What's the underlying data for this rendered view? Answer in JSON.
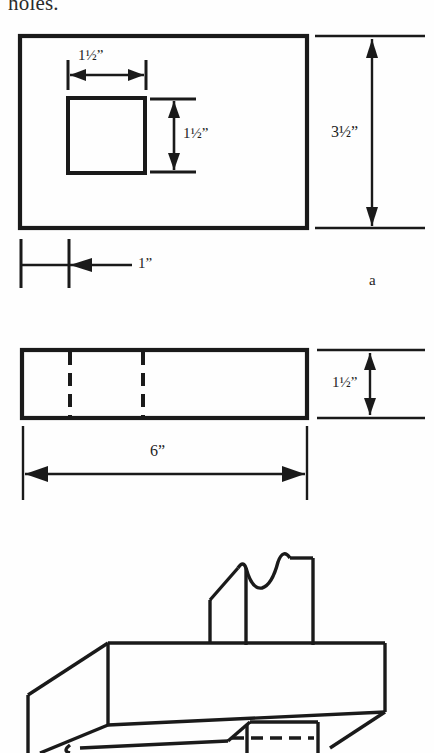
{
  "document": {
    "type": "technical-drawing-page",
    "caption_fragment": "holes.",
    "background_color": "#fefefe",
    "line_color": "#1a1a1a"
  },
  "figures": [
    {
      "id": "figure-a",
      "label": "a",
      "view": "front-view",
      "shape": "rectangle-with-square-hole",
      "dimensions": [
        {
          "name": "hole-width",
          "value": "1½”",
          "orientation": "horizontal"
        },
        {
          "name": "hole-height",
          "value": "1½”",
          "orientation": "vertical"
        },
        {
          "name": "plate-height",
          "value": "3½”",
          "orientation": "vertical"
        },
        {
          "name": "edge-offset",
          "value": "1”",
          "orientation": "horizontal"
        }
      ]
    },
    {
      "id": "figure-side",
      "view": "side-view",
      "shape": "rectangle-with-hidden-lines",
      "hidden_line_count": 2,
      "dimensions": [
        {
          "name": "stock-thickness",
          "value": "1½”",
          "orientation": "vertical"
        },
        {
          "name": "stock-length",
          "value": "6”",
          "orientation": "horizontal"
        }
      ]
    },
    {
      "id": "figure-isometric",
      "view": "isometric-pictorial",
      "shape": "block-with-shaped-profile-blade",
      "dimensions": []
    }
  ],
  "labels": {
    "hole_width": "1½”",
    "hole_height": "1½”",
    "plate_height": "3½”",
    "edge_offset": "1”",
    "stock_thickness": "1½”",
    "stock_length": "6”",
    "figure_a": "a"
  }
}
